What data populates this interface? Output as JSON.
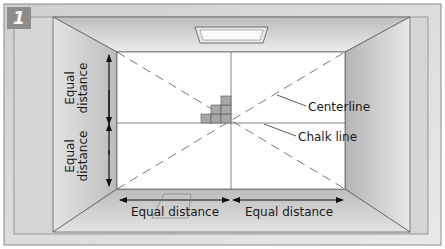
{
  "step_number": "1",
  "labels": {
    "centerline": "Centerline",
    "chalk_line": "Chalk line",
    "equal_distance_left_top": [
      "Equal",
      "distance"
    ],
    "equal_distance_left_bottom": [
      "Equal",
      "distance"
    ],
    "equal_distance_bottom_left": "Equal distance",
    "equal_distance_bottom_right": "Equal distance"
  },
  "colors": {
    "frame_bg": "#b8b8b8",
    "back_wall": "#ffffff",
    "tile": "#a9a9a9",
    "line": "#333333"
  }
}
